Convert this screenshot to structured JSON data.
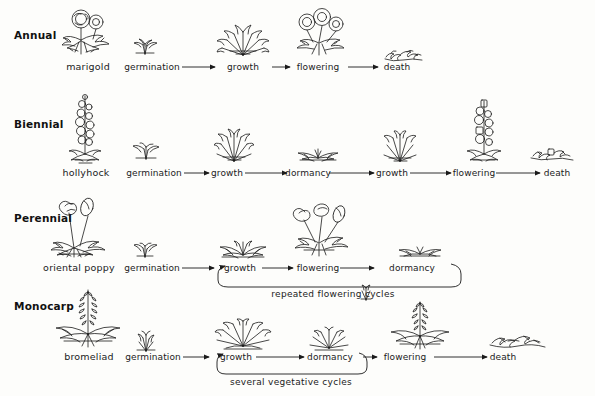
{
  "diagram": {
    "ink_color": "#1a1a1a",
    "background": "#fdfdfb"
  },
  "rows": [
    {
      "label": "Annual",
      "plant_name": "marigold",
      "stages": [
        "germination",
        "growth",
        "flowering",
        "death"
      ],
      "cycle_caption": ""
    },
    {
      "label": "Biennial",
      "plant_name": "hollyhock",
      "stages": [
        "germination",
        "growth",
        "dormancy",
        "growth",
        "flowering",
        "death"
      ],
      "cycle_caption": ""
    },
    {
      "label": "Perennial",
      "plant_name": "oriental poppy",
      "stages": [
        "germination",
        "growth",
        "flowering",
        "dormancy"
      ],
      "cycle_caption": "repeated flowering cycles"
    },
    {
      "label": "Monocarp",
      "plant_name": "bromeliad",
      "stages": [
        "germination",
        "growth",
        "dormancy",
        "flowering",
        "death"
      ],
      "cycle_caption": "several vegetative cycles"
    }
  ],
  "icons": {
    "marigold_plant": "marigold-flowering-plant-illustration",
    "hollyhock_plant": "hollyhock-flowering-spike-illustration",
    "poppy_plant": "oriental-poppy-flowering-plant-illustration",
    "bromeliad_plant": "bromeliad-flowering-rosette-illustration",
    "seedling": "seedling-sprout-illustration",
    "vegetative": "vegetative-leafy-clump-illustration",
    "dormant": "dormant-flattened-rosette-illustration",
    "dead": "dead-withered-plant-illustration",
    "flowering": "flowering-plant-illustration",
    "arrow": "right-arrow",
    "loop_arrow": "loop-back-arrow"
  }
}
